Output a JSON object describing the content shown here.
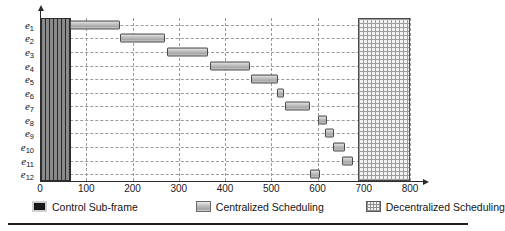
{
  "chart_data": {
    "type": "bar",
    "orientation": "horizontal",
    "title": "",
    "xlabel": "",
    "ylabel": "",
    "xlim": [
      0,
      830
    ],
    "xticks": [
      0,
      100,
      200,
      300,
      400,
      500,
      600,
      700,
      800
    ],
    "xtick_labels": [
      "0",
      "100",
      "200",
      "300",
      "400",
      "500",
      "600",
      "700",
      "800"
    ],
    "categories": [
      "e1",
      "e2",
      "e3",
      "e4",
      "e5",
      "e6",
      "e7",
      "e8",
      "e9",
      "e10",
      "e11",
      "e12"
    ],
    "category_labels": [
      "e",
      "e",
      "e",
      "e",
      "e",
      "e",
      "e",
      "e",
      "e",
      "e",
      "e",
      "e"
    ],
    "category_subscripts": [
      "1",
      "2",
      "3",
      "4",
      "5",
      "6",
      "7",
      "8",
      "9",
      "10",
      "11",
      "12"
    ],
    "grid": true,
    "legend_position": "below-axis",
    "series": [
      {
        "name": "Control Sub-frame",
        "style": "control",
        "spans_all_rows": true,
        "start": 0,
        "end": 66
      },
      {
        "name": "Centralized Scheduling",
        "style": "centralized",
        "bars": [
          {
            "category": "e1",
            "start": 65,
            "end": 173
          },
          {
            "category": "e2",
            "start": 173,
            "end": 270
          },
          {
            "category": "e3",
            "start": 275,
            "end": 363
          },
          {
            "category": "e4",
            "start": 368,
            "end": 454
          },
          {
            "category": "e5",
            "start": 456,
            "end": 515
          },
          {
            "category": "e6",
            "start": 513,
            "end": 528
          },
          {
            "category": "e7",
            "start": 530,
            "end": 584
          },
          {
            "category": "e8",
            "start": 601,
            "end": 620
          },
          {
            "category": "e9",
            "start": 617,
            "end": 636
          },
          {
            "category": "e10",
            "start": 634,
            "end": 660
          },
          {
            "category": "e11",
            "start": 653,
            "end": 677
          },
          {
            "category": "e12",
            "start": 584,
            "end": 606
          }
        ]
      },
      {
        "name": "Decentralized Scheduling",
        "style": "decentralized",
        "spans_all_rows": true,
        "start": 688,
        "end": 800
      }
    ]
  },
  "legend": {
    "items": [
      {
        "label": "Control Sub-frame",
        "swatch": "control"
      },
      {
        "label": "Centralized Scheduling",
        "swatch": "centralized"
      },
      {
        "label": "Decentralized Scheduling",
        "swatch": "decentralized"
      }
    ]
  },
  "colors": {
    "axis": "#2b2b2b",
    "grid": "#9a9a9a",
    "control_fill": "#6f6f6f",
    "centralized_fill": "#b8b8b8",
    "decentralized_fill": "#f2f2f2",
    "text": "#141414",
    "rule": "#1e1e1e"
  }
}
